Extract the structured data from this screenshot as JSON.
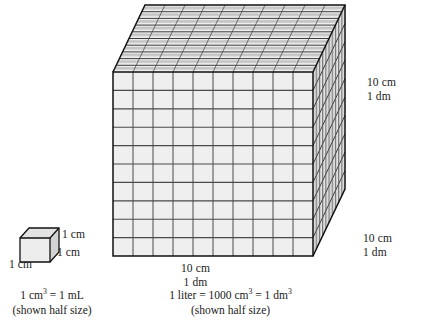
{
  "figure": {
    "colors": {
      "front_face": "#efefef",
      "top_face_band": "#c9c9c9",
      "side_face_band": "#d4d4d4",
      "grid_line": "#4a4a4a",
      "outline": "#1a1a1a",
      "background": "#ffffff",
      "text": "#1a1a1a"
    },
    "big_cube": {
      "name": "liter-cube",
      "grid_columns": 10,
      "grid_rows": 10,
      "grid_depth": 10,
      "total_unit_cubes": 1000
    },
    "small_cube": {
      "name": "cubic-centimeter-cube",
      "grid_columns": 1,
      "grid_rows": 1,
      "grid_depth": 1
    }
  },
  "labels": {
    "big_right_top": {
      "line1": "10 cm",
      "line2": "1 dm"
    },
    "big_right_bottom": {
      "line1": "10 cm",
      "line2": "1 dm"
    },
    "big_bottom": {
      "line1": "10 cm",
      "line2": "1 dm"
    },
    "small_right": "1 cm",
    "small_diagonal": "1 cm",
    "small_left": "1 cm"
  },
  "captions": {
    "small_cube": {
      "equation_prefix": "1 cm",
      "equation_exponent": "3",
      "equation_suffix": " = 1 mL",
      "note": "(shown half size)"
    },
    "big_cube": {
      "equation_prefix": "1 liter = 1000 cm",
      "equation_exponent_1": "3",
      "equation_middle": " = 1 dm",
      "equation_exponent_2": "3",
      "note": "(shown half size)"
    }
  }
}
